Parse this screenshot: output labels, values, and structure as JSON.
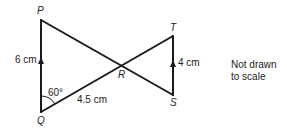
{
  "diagram": {
    "points": {
      "P": {
        "label": "P",
        "x": 41,
        "y": 20
      },
      "Q": {
        "label": "Q",
        "x": 41,
        "y": 112
      },
      "R": {
        "label": "R",
        "x": 120,
        "y": 65
      },
      "T": {
        "label": "T",
        "x": 173,
        "y": 36
      },
      "S": {
        "label": "S",
        "x": 173,
        "y": 95
      }
    },
    "measurements": {
      "PQ": "6 cm",
      "TS": "4 cm",
      "QR": "4.5 cm",
      "angle_PQR": "60°"
    },
    "note": {
      "line1": "Not drawn",
      "line2": "to scale"
    }
  }
}
